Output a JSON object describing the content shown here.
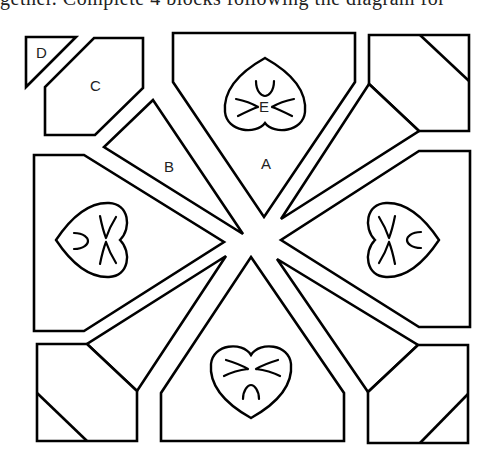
{
  "caption_clipped": "gether. Complete 4 blocks following the diagram for",
  "diagram": {
    "type": "quilt-block-pattern",
    "labels": {
      "A": "A",
      "B": "B",
      "C": "C",
      "D": "D",
      "E": "E"
    },
    "stroke_color": "#000000",
    "fill_color": "#ffffff"
  }
}
